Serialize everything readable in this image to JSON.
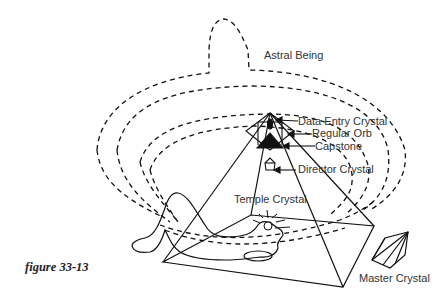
{
  "figure": {
    "caption": "figure 33-13",
    "labels": {
      "astral_being": "Astral Being",
      "data_entry_crystal": "Data Entry Crystal",
      "regular_orb": "Regular Orb",
      "capstone": "Capstone",
      "director_crystal": "Director Crystal",
      "temple_crystal": "Temple Crystal",
      "master_crystal": "Master Crystal"
    }
  },
  "colors": {
    "line": "#111111",
    "text": "#333333",
    "background": "#ffffff"
  }
}
